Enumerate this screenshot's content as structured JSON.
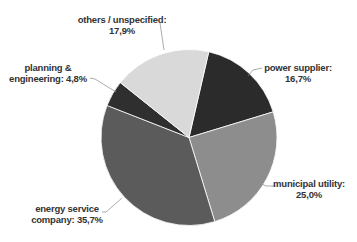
{
  "chart_data": {
    "type": "pie",
    "title": "",
    "start_angle_deg": 13,
    "direction": "clockwise",
    "center": [
      189,
      137.5
    ],
    "radius": 88,
    "slices": [
      {
        "label": "power supplier",
        "value": 16.7,
        "display": "16,7%",
        "color": "#2b2b2b"
      },
      {
        "label": "municipal utility",
        "value": 25.0,
        "display": "25,0%",
        "color": "#8d8d8d"
      },
      {
        "label": "energy service company",
        "value": 35.7,
        "display": "35,7%",
        "color": "#5b5b5b"
      },
      {
        "label": "planning & engineering",
        "value": 4.8,
        "display": "4,8%",
        "color": "#2f2f2f"
      },
      {
        "label": "others / unspecified",
        "value": 17.9,
        "display": "17,9%",
        "color": "#d9d9d9"
      }
    ],
    "legend": "none (data labels with leader lines)"
  },
  "labels": {
    "others": {
      "line1": "others / unspecified:",
      "line2": "17,9%"
    },
    "power": {
      "line1": "power supplier:",
      "line2": "16,7%"
    },
    "planning": {
      "line1": "planning &",
      "line2": "engineering: 4,8%"
    },
    "municipal": {
      "line1": "municipal utility:",
      "line2": "25,0%"
    },
    "energy": {
      "line1": "energy service",
      "line2": "company: 35,7%"
    }
  }
}
